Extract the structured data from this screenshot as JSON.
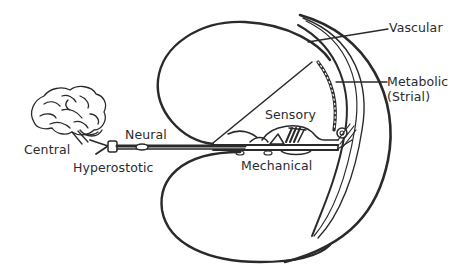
{
  "diagram": {
    "labels": {
      "central": "Central",
      "hyperostotic": "Hyperostotic",
      "neural": "Neural",
      "sensory": "Sensory",
      "mechanical": "Mechanical",
      "vascular": "Vascular",
      "metabolic_line1": "Metabolic",
      "metabolic_line2": "(Strial)"
    },
    "icons": {
      "brain": "brain-icon",
      "nerve": "auditory-nerve",
      "cochlea": "cochlear-duct"
    },
    "colors": {
      "line": "#2a2a2a",
      "background": "#ffffff"
    }
  }
}
